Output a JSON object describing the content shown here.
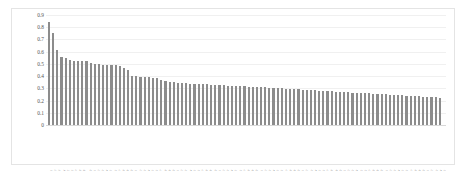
{
  "figure": {
    "background_color": "#ffffff",
    "frame_color": "#e4e4e4",
    "bar_color": "#8c8c8c",
    "gridline_color": "#f0f0f0"
  },
  "chart_data": {
    "type": "bar",
    "title": "",
    "subtitle": "",
    "xlabel": "",
    "ylabel": "Bad <- Mean(RusSTDEV) -> Good",
    "ylim": [
      0,
      0.9
    ],
    "yticks": [
      "0",
      "0.1",
      "0.2",
      "0.3",
      "0.4",
      "0.5",
      "0.6",
      "0.7",
      "0.8",
      "0.9"
    ],
    "ytick_values": [
      0,
      0.1,
      0.2,
      0.3,
      0.4,
      0.5,
      0.6,
      0.7,
      0.8,
      0.9
    ],
    "grid": true,
    "legend": null,
    "legend_position": "none",
    "annotations": [],
    "xtick_labels_rotated": true,
    "xtick_labels_legible": false,
    "categories": [
      "C1",
      "C2",
      "C3",
      "C4",
      "C5",
      "C6",
      "C7",
      "C8",
      "C9",
      "C10",
      "C11",
      "C12",
      "C13",
      "C14",
      "C15",
      "C16",
      "C17",
      "C18",
      "C19",
      "C20",
      "C21",
      "C22",
      "C23",
      "C24",
      "C25",
      "C26",
      "C27",
      "C28",
      "C29",
      "C30",
      "C31",
      "C32",
      "C33",
      "C34",
      "C35",
      "C36",
      "C37",
      "C38",
      "C39",
      "C40",
      "C41",
      "C42",
      "C43",
      "C44",
      "C45",
      "C46",
      "C47",
      "C48",
      "C49",
      "C50",
      "C51",
      "C52",
      "C53",
      "C54",
      "C55",
      "C56",
      "C57",
      "C58",
      "C59",
      "C60",
      "C61",
      "C62",
      "C63",
      "C64",
      "C65",
      "C66",
      "C67",
      "C68",
      "C69",
      "C70",
      "C71",
      "C72",
      "C73",
      "C74",
      "C75",
      "C76",
      "C77",
      "C78",
      "C79",
      "C80",
      "C81",
      "C82",
      "C83",
      "C84",
      "C85",
      "C86",
      "C87",
      "C88",
      "C89",
      "C90",
      "C91",
      "C92",
      "C93",
      "C94",
      "C95"
    ],
    "values": [
      0.84,
      0.755,
      0.61,
      0.56,
      0.548,
      0.53,
      0.527,
      0.525,
      0.522,
      0.52,
      0.505,
      0.5,
      0.498,
      0.495,
      0.49,
      0.488,
      0.487,
      0.486,
      0.47,
      0.45,
      0.4,
      0.398,
      0.396,
      0.392,
      0.39,
      0.388,
      0.385,
      0.37,
      0.36,
      0.352,
      0.348,
      0.345,
      0.342,
      0.34,
      0.338,
      0.336,
      0.335,
      0.334,
      0.332,
      0.33,
      0.328,
      0.326,
      0.324,
      0.322,
      0.32,
      0.318,
      0.317,
      0.316,
      0.315,
      0.314,
      0.312,
      0.31,
      0.308,
      0.306,
      0.304,
      0.302,
      0.3,
      0.298,
      0.296,
      0.294,
      0.292,
      0.29,
      0.288,
      0.286,
      0.284,
      0.282,
      0.28,
      0.278,
      0.276,
      0.274,
      0.272,
      0.27,
      0.268,
      0.266,
      0.264,
      0.262,
      0.26,
      0.258,
      0.256,
      0.254,
      0.252,
      0.25,
      0.248,
      0.246,
      0.244,
      0.242,
      0.24,
      0.238,
      0.236,
      0.234,
      0.232,
      0.23,
      0.228,
      0.226,
      0.224
    ]
  }
}
